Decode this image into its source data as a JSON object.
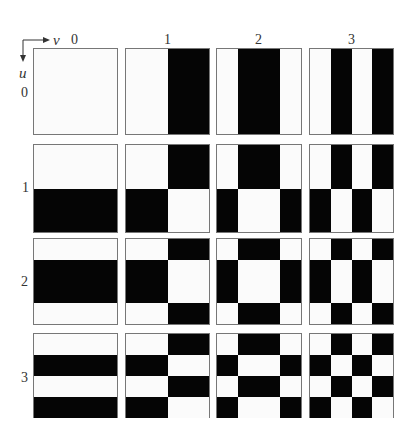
{
  "figure": {
    "h_axis": {
      "variable": "v",
      "labels": [
        "0",
        "1",
        "2",
        "3"
      ]
    },
    "v_axis": {
      "variable": "u",
      "labels": [
        "0",
        "1",
        "2",
        "3"
      ]
    },
    "colors": {
      "on": "#050505",
      "off": "#fbfbfb",
      "border": "#777777"
    },
    "sequences": [
      [
        0,
        0,
        0,
        0
      ],
      [
        0,
        0,
        1,
        1
      ],
      [
        0,
        1,
        1,
        0
      ],
      [
        0,
        1,
        0,
        1
      ]
    ],
    "rule": "pixel(i,j) of cell(u,v) is black when seq[u][i] XOR seq[v][j] = 1"
  }
}
